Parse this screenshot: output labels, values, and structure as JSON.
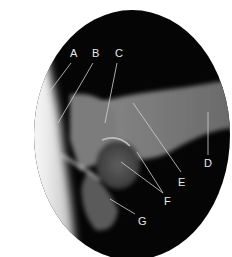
{
  "figure": {
    "labels": [
      {
        "id": "A",
        "text": "A",
        "x": 74,
        "y": 57,
        "line": [
          71,
          63,
          47,
          95
        ]
      },
      {
        "id": "B",
        "text": "B",
        "x": 96,
        "y": 57,
        "line": [
          93,
          63,
          58,
          123
        ]
      },
      {
        "id": "C",
        "text": "C",
        "x": 119,
        "y": 57,
        "line": [
          117,
          63,
          105,
          123
        ]
      },
      {
        "id": "D",
        "text": "D",
        "x": 208,
        "y": 167,
        "line": [
          208,
          112,
          208,
          155
        ]
      },
      {
        "id": "E",
        "text": "E",
        "x": 182,
        "y": 186,
        "line": [
          133,
          103,
          181,
          172
        ]
      },
      {
        "id": "F",
        "text": "F",
        "x": 168,
        "y": 205,
        "line": [
          121,
          162,
          163,
          193
        ]
      },
      {
        "id": "F2",
        "text": "",
        "x": 0,
        "y": 0,
        "line": [
          137,
          152,
          163,
          193
        ]
      },
      {
        "id": "G",
        "text": "G",
        "x": 142,
        "y": 225,
        "line": [
          110,
          199,
          135,
          214
        ]
      }
    ]
  },
  "colors": {
    "background": "#ffffff",
    "film_dark": "#050505",
    "bone_light": "#9a9a9a",
    "soft_tissue_white": "#f4f4f4",
    "label_text": "#e8e8e8"
  }
}
